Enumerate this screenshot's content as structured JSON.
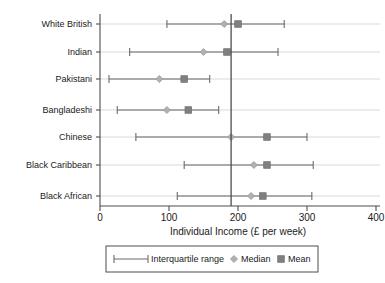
{
  "chart_data": {
    "type": "scatter",
    "title": "",
    "xlabel": "Individual Income (£ per week)",
    "ylabel": "",
    "xlim": [
      0,
      400
    ],
    "xticks": [
      0,
      100,
      200,
      300,
      400
    ],
    "xtick_labels": [
      "0",
      "100",
      "200",
      "300",
      "400"
    ],
    "grid": true,
    "legend_position": "bottom",
    "reference_line": 190,
    "categories": [
      "White British",
      "Indian",
      "Pakistani",
      "Bangladeshi",
      "Chinese",
      "Black Caribbean",
      "Black African"
    ],
    "series": [
      {
        "name": "Interquartile range",
        "marker": "whisker-bar"
      },
      {
        "name": "Median",
        "marker": "diamond"
      },
      {
        "name": "Mean",
        "marker": "square"
      }
    ],
    "rows": [
      {
        "category": "White British",
        "q1": 97,
        "q3": 267,
        "median": 180,
        "mean": 200
      },
      {
        "category": "Indian",
        "q1": 43,
        "q3": 258,
        "median": 150,
        "mean": 184
      },
      {
        "category": "Pakistani",
        "q1": 13,
        "q3": 159,
        "median": 86,
        "mean": 122
      },
      {
        "category": "Bangladeshi",
        "q1": 25,
        "q3": 172,
        "median": 97,
        "mean": 128
      },
      {
        "category": "Chinese",
        "q1": 52,
        "q3": 300,
        "median": 190,
        "mean": 242
      },
      {
        "category": "Black Caribbean",
        "q1": 122,
        "q3": 309,
        "median": 223,
        "mean": 242
      },
      {
        "category": "Black African",
        "q1": 112,
        "q3": 307,
        "median": 219,
        "mean": 236
      }
    ],
    "colors": {
      "whisker": "#6b6b6b",
      "median": "#b0b0b0",
      "mean": "#808080",
      "grid": "#d9d9d9",
      "axis": "#4d4d4d",
      "reference_line": "#4d4d4d"
    }
  },
  "legend": {
    "items": [
      {
        "label": "Interquartile range",
        "marker": "whisker-bar"
      },
      {
        "label": "Median",
        "marker": "diamond"
      },
      {
        "label": "Mean",
        "marker": "square"
      }
    ]
  }
}
